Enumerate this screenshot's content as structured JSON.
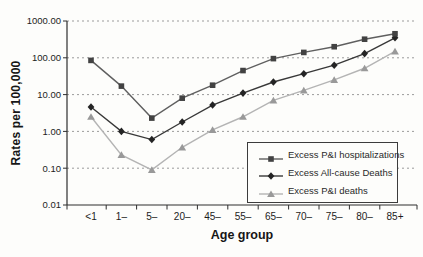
{
  "chart_data": {
    "type": "line",
    "title": "",
    "xlabel": "Age group",
    "ylabel": "Rates per 100,000",
    "y_scale": "log10",
    "ylim": [
      0.01,
      1000
    ],
    "y_ticks": [
      1000,
      100,
      10,
      1,
      0.1,
      0.01
    ],
    "y_tick_labels": [
      "1000.00",
      "100.00",
      "10.00",
      "1.00",
      "0.10",
      "0.01"
    ],
    "grid": "horizontal dashed",
    "legend_position": "inside lower right",
    "categories": [
      "<1",
      "1–",
      "5–",
      "20–",
      "45–",
      "55–",
      "65–",
      "70–",
      "75–",
      "80–",
      "85+"
    ],
    "series": [
      {
        "name": "Excess P&I hospitalizations",
        "marker": "square",
        "line_color": "#5f5f5f",
        "marker_color": "#424242",
        "values": [
          85,
          17,
          2.3,
          8,
          18,
          45,
          95,
          140,
          200,
          320,
          450
        ]
      },
      {
        "name": "Excess All-cause Deaths",
        "marker": "diamond",
        "line_color": "#383838",
        "marker_color": "#242424",
        "values": [
          4.6,
          1.0,
          0.6,
          1.8,
          5.2,
          11,
          22,
          37,
          63,
          130,
          350
        ]
      },
      {
        "name": "Excess P&I deaths",
        "marker": "triangle",
        "line_color": "#b4b4b4",
        "marker_color": "#999999",
        "values": [
          2.5,
          0.23,
          0.09,
          0.37,
          1.1,
          2.5,
          7,
          13,
          25,
          52,
          150
        ]
      }
    ],
    "colors": {
      "axis": "#2e2e2e",
      "gridline": "#909090",
      "text": "#1c1c1c",
      "background": "#fdfdfb"
    }
  }
}
